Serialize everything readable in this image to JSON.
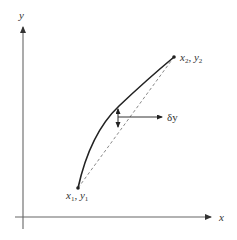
{
  "diagram": {
    "axes": {
      "x_label": "x",
      "y_label": "y"
    },
    "points": {
      "start": {
        "x_sym": "x",
        "x_sub": "1",
        "sep": ", ",
        "y_sym": "y",
        "y_sub": "1"
      },
      "end": {
        "x_sym": "x",
        "x_sub": "2",
        "sep": ", ",
        "y_sym": "y",
        "y_sub": "2"
      }
    },
    "deviation_label": "δy",
    "elements": {
      "curve": "solid curved path from (x1, y1) to (x2, y2)",
      "chord": "dashed straight line from (x1, y1) to (x2, y2)",
      "deviation_arrow": "double-headed vertical arrow between curve and chord",
      "pointer_arrow": "horizontal arrow pointing to δy label"
    },
    "colors": {
      "axis": "#555555",
      "curve": "#222222",
      "chord": "#777777",
      "text": "#333333"
    }
  }
}
